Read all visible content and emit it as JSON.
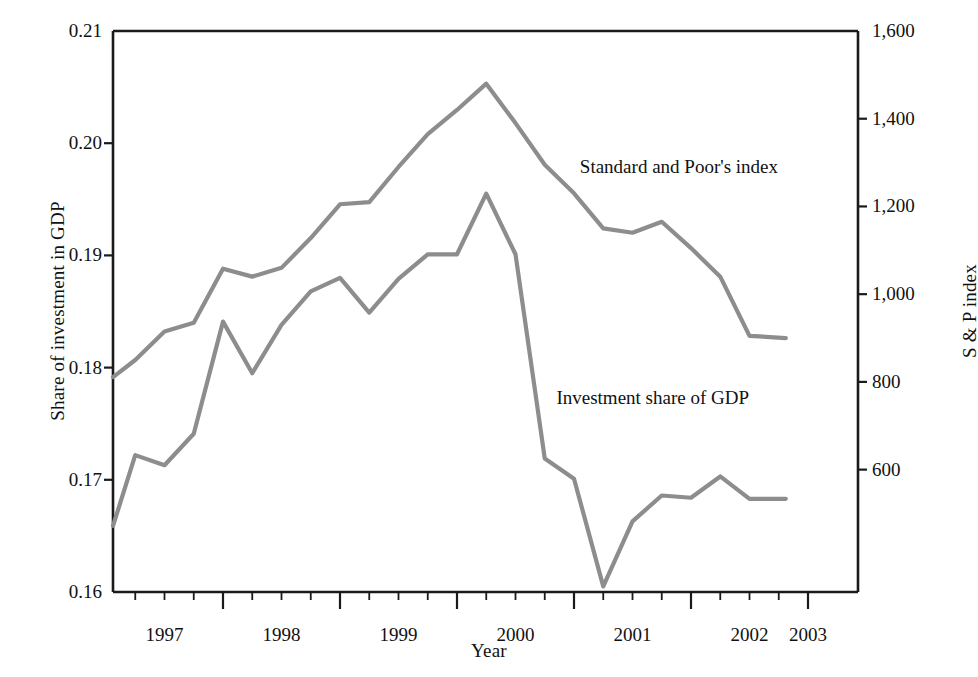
{
  "chart_data": {
    "type": "line",
    "title": "",
    "xlabel": "Year",
    "ylabel": "Share of investment in GDP",
    "ylabel_right": "S & P index",
    "xlim": [
      1997.06,
      2002.81
    ],
    "ylim": [
      0.16,
      0.21
    ],
    "ylim_right": [
      321,
      1600
    ],
    "grid": false,
    "legend_position": "inline-annotation",
    "ytick_labels_left": [
      "0.16",
      "0.17",
      "0.18",
      "0.19",
      "0.20",
      "0.21"
    ],
    "ytick_values_left": [
      0.16,
      0.17,
      0.18,
      0.19,
      0.2,
      0.21
    ],
    "ytick_labels_right": [
      "600",
      "800",
      "1,000",
      "1,200",
      "1,400",
      "1,600"
    ],
    "ytick_values_right": [
      600,
      800,
      1000,
      1200,
      1400,
      1600
    ],
    "xtick_labels": [
      "1997",
      "1998",
      "1999",
      "2000",
      "2001",
      "2002",
      "2003"
    ],
    "xtick_values": [
      1997,
      1998,
      1999,
      2000,
      2001,
      2002,
      2003
    ],
    "xminor_step": 0.25,
    "line_color": "#8d8d8d",
    "axis_color": "#1a1a1a",
    "series": [
      {
        "name": "Standard and Poor's index",
        "axis": "right",
        "label_x": 2001.05,
        "label_y": 1290,
        "x": [
          1997.06,
          1997.25,
          1997.5,
          1997.75,
          1998.0,
          1998.25,
          1998.5,
          1998.75,
          1999.0,
          1999.25,
          1999.5,
          1999.75,
          2000.0,
          2000.25,
          2000.5,
          2000.75,
          2001.0,
          2001.25,
          2001.5,
          2001.75,
          2002.0,
          2002.25,
          2002.5,
          2002.81
        ],
        "values": [
          811,
          850,
          915,
          935,
          1058,
          1040,
          1060,
          1128,
          1205,
          1210,
          1290,
          1365,
          1420,
          1480,
          1390,
          1295,
          1230,
          1150,
          1140,
          1165,
          1105,
          1040,
          905,
          900
        ],
        "values_detail": [
          811,
          850,
          915,
          935,
          1058,
          1040,
          1060,
          1128,
          1205,
          1210,
          1290,
          1365,
          1420,
          1480,
          1390,
          1295,
          1230,
          1150,
          1140,
          1165,
          1105,
          1040,
          905,
          900
        ]
      },
      {
        "name": "Investment share of GDP",
        "axis": "left",
        "label_x": 2000.85,
        "label_y": 0.1773,
        "x": [
          1997.06,
          1997.25,
          1997.5,
          1997.75,
          1998.0,
          1998.25,
          1998.5,
          1998.75,
          1999.0,
          1999.25,
          1999.5,
          1999.75,
          2000.0,
          2000.25,
          2000.5,
          2000.75,
          2001.0,
          2001.25,
          2001.5,
          2001.75,
          2002.0,
          2002.25,
          2002.5,
          2002.81
        ],
        "values": [
          0.1659,
          0.1722,
          0.1713,
          0.1741,
          0.1841,
          0.1795,
          0.1838,
          0.1868,
          0.188,
          0.1849,
          0.1879,
          0.1901,
          0.1901,
          0.1955,
          0.1901,
          0.1719,
          0.1701,
          0.1605,
          0.1663,
          0.1686,
          0.1684,
          0.1703,
          0.1683,
          0.1683
        ],
        "values_detail": [
          0.1659,
          0.1722,
          0.1713,
          0.1741,
          0.1841,
          0.1795,
          0.1838,
          0.1868,
          0.188,
          0.1849,
          0.1879,
          0.1901,
          0.1901,
          0.1955,
          0.1901,
          0.1719,
          0.1701,
          0.1605,
          0.1663,
          0.1686,
          0.1684,
          0.1703,
          0.1683,
          0.1683
        ]
      }
    ]
  },
  "axes": {
    "x_title": "Year",
    "y_left_title": "Share of investment in GDP",
    "y_right_title": "S & P index"
  },
  "annotations": {
    "sp_label": "Standard and Poor's index",
    "inv_label": "Investment share of GDP"
  }
}
